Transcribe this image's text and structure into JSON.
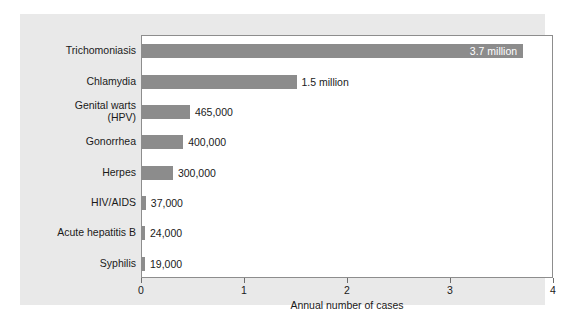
{
  "chart_data": {
    "type": "bar",
    "orientation": "horizontal",
    "title": "",
    "xlabel": "Annual number of cases",
    "ylabel": "",
    "xlim": [
      0,
      4
    ],
    "x_unit": "millions",
    "xticks": [
      0,
      1,
      2,
      3,
      4
    ],
    "xtick_labels": [
      "0",
      "1",
      "2",
      "3",
      "4"
    ],
    "grid": false,
    "legend": null,
    "bar_color": "#8c8c8c",
    "plot_background": "#ffffff",
    "figure_background": "#e9e9e9",
    "categories": [
      "Trichomoniasis",
      "Chlamydia",
      "Genital warts\n(HPV)",
      "Gonorrhea",
      "Herpes",
      "HIV/AIDS",
      "Acute hepatitis B",
      "Syphilis"
    ],
    "values": [
      3.7,
      1.5,
      0.465,
      0.4,
      0.3,
      0.037,
      0.024,
      0.019
    ],
    "value_labels": [
      "3.7 million",
      "1.5 million",
      "465,000",
      "400,000",
      "300,000",
      "37,000",
      "24,000",
      "19,000"
    ],
    "label_placement": [
      "inside",
      "outside",
      "outside",
      "outside",
      "outside",
      "outside",
      "outside",
      "outside"
    ]
  }
}
